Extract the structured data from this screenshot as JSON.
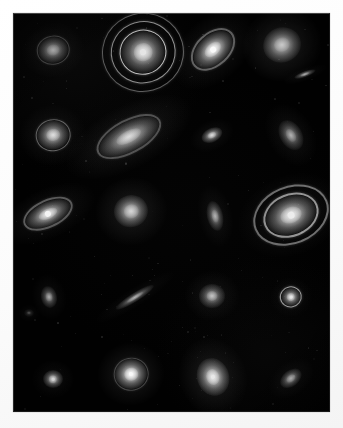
{
  "figure": {
    "kind": "astronomical-plate-mosaic",
    "caption": "",
    "background_color": "#010101",
    "page_color": "#fdfdfd",
    "plate": {
      "x": 13,
      "y": 13,
      "width": 317,
      "height": 399
    },
    "grid": {
      "columns": 4,
      "rows": 5,
      "object_count": 22
    }
  },
  "chart_data": {
    "type": "scatter",
    "title": "",
    "xlabel": "",
    "ylabel": "",
    "grid": false,
    "legend": null,
    "xlim": [
      0,
      317
    ],
    "ylim": [
      0,
      399
    ],
    "note": "Positions are plate pixel coordinates relative to the dark panel; size in px; angle in degrees; brightness 0-1.",
    "objects": [
      {
        "id": "r1c1",
        "label": "round galaxy with bright core",
        "morphology": "round",
        "x": 40,
        "y": 37,
        "w": 30,
        "h": 26,
        "angle": -10,
        "brightness": 0.78,
        "rings": 1,
        "ring_strength": 0.3,
        "core": 0.55,
        "halo": 0.3
      },
      {
        "id": "r1c2",
        "label": "ringed galaxy, concentric rings",
        "morphology": "ring",
        "x": 130,
        "y": 39,
        "w": 44,
        "h": 42,
        "angle": -15,
        "brightness": 0.92,
        "rings": 3,
        "ring_strength": 0.85,
        "core": 0.95,
        "halo": 0.18
      },
      {
        "id": "r1c3",
        "label": "inclined spiral galaxy",
        "morphology": "spiral-inclined",
        "x": 200,
        "y": 37,
        "w": 46,
        "h": 30,
        "angle": -42,
        "brightness": 0.88,
        "rings": 1,
        "ring_strength": 0.38,
        "core": 0.9,
        "halo": 0.34
      },
      {
        "id": "r1c4",
        "label": "large round elliptical galaxy",
        "morphology": "elliptical",
        "x": 269,
        "y": 32,
        "w": 38,
        "h": 35,
        "angle": -20,
        "brightness": 0.85,
        "rings": 0,
        "ring_strength": 0.0,
        "core": 0.55,
        "halo": 0.52
      },
      {
        "id": "r1c4b",
        "label": "small edge-on sliver galaxy",
        "morphology": "edge-on",
        "x": 292,
        "y": 61,
        "w": 22,
        "h": 6,
        "angle": -20,
        "brightness": 0.6,
        "rings": 0,
        "ring_strength": 0.0,
        "core": 0.5,
        "halo": 0.18
      },
      {
        "id": "r2c1",
        "label": "round galaxy with faint outer ring",
        "morphology": "ring",
        "x": 40,
        "y": 122,
        "w": 32,
        "h": 29,
        "angle": -10,
        "brightness": 0.8,
        "rings": 1,
        "ring_strength": 0.4,
        "core": 0.72,
        "halo": 0.28
      },
      {
        "id": "r2c2",
        "label": "large inclined spiral with disk halo",
        "morphology": "spiral-inclined",
        "x": 116,
        "y": 124,
        "w": 66,
        "h": 30,
        "angle": -28,
        "brightness": 0.82,
        "rings": 1,
        "ring_strength": 0.32,
        "core": 0.78,
        "halo": 0.38
      },
      {
        "id": "r2c3",
        "label": "small oval galaxy",
        "morphology": "oval",
        "x": 199,
        "y": 122,
        "w": 22,
        "h": 14,
        "angle": -25,
        "brightness": 0.78,
        "rings": 0,
        "ring_strength": 0.0,
        "core": 0.75,
        "halo": 0.22
      },
      {
        "id": "r2c4",
        "label": "faint elongated oval galaxy",
        "morphology": "oval",
        "x": 278,
        "y": 122,
        "w": 22,
        "h": 32,
        "angle": -30,
        "brightness": 0.52,
        "rings": 0,
        "ring_strength": 0.0,
        "core": 0.42,
        "halo": 0.26
      },
      {
        "id": "r3c1",
        "label": "inclined spiral galaxy with disk",
        "morphology": "spiral-inclined",
        "x": 35,
        "y": 201,
        "w": 48,
        "h": 24,
        "angle": -25,
        "brightness": 0.8,
        "rings": 1,
        "ring_strength": 0.35,
        "core": 0.82,
        "halo": 0.3
      },
      {
        "id": "r3c2",
        "label": "round bright galaxy",
        "morphology": "round",
        "x": 118,
        "y": 198,
        "w": 34,
        "h": 32,
        "angle": -15,
        "brightness": 0.84,
        "rings": 0,
        "ring_strength": 0.0,
        "core": 0.62,
        "halo": 0.45
      },
      {
        "id": "r3c3",
        "label": "elongated near-vertical galaxy",
        "morphology": "oval",
        "x": 202,
        "y": 203,
        "w": 16,
        "h": 30,
        "angle": -12,
        "brightness": 0.62,
        "rings": 0,
        "ring_strength": 0.0,
        "core": 0.48,
        "halo": 0.25
      },
      {
        "id": "r3c4",
        "label": "elliptical ring galaxy with bright nucleus",
        "morphology": "ring",
        "x": 278,
        "y": 202,
        "w": 52,
        "h": 38,
        "angle": -22,
        "brightness": 0.88,
        "rings": 2,
        "ring_strength": 0.62,
        "core": 0.88,
        "halo": 0.3
      },
      {
        "id": "r4c1",
        "label": "faint small oval galaxy",
        "morphology": "oval",
        "x": 36,
        "y": 284,
        "w": 16,
        "h": 22,
        "angle": -12,
        "brightness": 0.48,
        "rings": 0,
        "ring_strength": 0.0,
        "core": 0.4,
        "halo": 0.2
      },
      {
        "id": "r4c2",
        "label": "thin edge-on disk galaxy",
        "morphology": "edge-on",
        "x": 122,
        "y": 284,
        "w": 44,
        "h": 9,
        "angle": -32,
        "brightness": 0.55,
        "rings": 0,
        "ring_strength": 0.0,
        "core": 0.45,
        "halo": 0.16
      },
      {
        "id": "r4c3",
        "label": "fuzzy round galaxy",
        "morphology": "round",
        "x": 199,
        "y": 283,
        "w": 26,
        "h": 24,
        "angle": 0,
        "brightness": 0.66,
        "rings": 0,
        "ring_strength": 0.0,
        "core": 0.6,
        "halo": 0.3
      },
      {
        "id": "r4c4",
        "label": "compact ringed galaxy with point core",
        "morphology": "ring",
        "x": 278,
        "y": 284,
        "w": 20,
        "h": 19,
        "angle": -10,
        "brightness": 0.82,
        "rings": 1,
        "ring_strength": 0.7,
        "core": 0.92,
        "halo": 0.18
      },
      {
        "id": "r5c1",
        "label": "compact bright point galaxy",
        "morphology": "round",
        "x": 40,
        "y": 366,
        "w": 20,
        "h": 18,
        "angle": 0,
        "brightness": 0.78,
        "rings": 0,
        "ring_strength": 0.0,
        "core": 0.85,
        "halo": 0.22
      },
      {
        "id": "r5c2",
        "label": "round galaxy with bright nucleus",
        "morphology": "round",
        "x": 118,
        "y": 361,
        "w": 32,
        "h": 30,
        "angle": -10,
        "brightness": 0.9,
        "rings": 1,
        "ring_strength": 0.25,
        "core": 0.95,
        "halo": 0.42
      },
      {
        "id": "r5c3",
        "label": "bright elongated galaxy",
        "morphology": "oval",
        "x": 200,
        "y": 364,
        "w": 32,
        "h": 38,
        "angle": -18,
        "brightness": 0.92,
        "rings": 0,
        "ring_strength": 0.0,
        "core": 0.88,
        "halo": 0.46
      },
      {
        "id": "r5c4",
        "label": "small tilted oval galaxy",
        "morphology": "oval",
        "x": 278,
        "y": 365,
        "w": 24,
        "h": 16,
        "angle": -38,
        "brightness": 0.72,
        "rings": 0,
        "ring_strength": 0.0,
        "core": 0.65,
        "halo": 0.22
      },
      {
        "id": "r4c2b",
        "label": "faint background smudge",
        "morphology": "round",
        "x": 16,
        "y": 300,
        "w": 10,
        "h": 8,
        "angle": 0,
        "brightness": 0.18,
        "rings": 0,
        "ring_strength": 0.0,
        "core": 0.2,
        "halo": 0.12
      }
    ]
  }
}
